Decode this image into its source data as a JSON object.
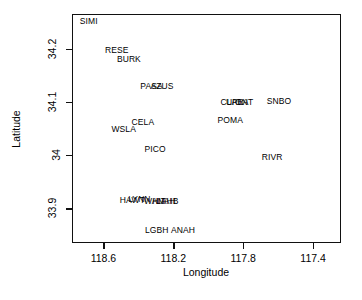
{
  "chart_data": {
    "type": "scatter",
    "title": "",
    "xlabel": "Longitude",
    "ylabel": "Latitude",
    "xlim": [
      118.78,
      117.24
    ],
    "ylim": [
      33.835,
      34.265
    ],
    "x_tick_labels": [
      "118.6",
      "118.2",
      "117.8",
      "117.4"
    ],
    "x_tick_values": [
      118.6,
      118.2,
      117.8,
      117.4
    ],
    "y_tick_labels": [
      "33.9",
      "34",
      "34.1",
      "34.2"
    ],
    "y_tick_values": [
      33.9,
      34.0,
      34.1,
      34.2
    ],
    "grid": false,
    "legend": "none",
    "marker": "text-label",
    "note": "Points are drawn as 4-letter station code text labels instead of symbols.",
    "points": [
      {
        "label": "SIMI",
        "x": 118.69,
        "y": 34.253
      },
      {
        "label": "RESE",
        "x": 118.53,
        "y": 34.199
      },
      {
        "label": "BURK",
        "x": 118.46,
        "y": 34.183
      },
      {
        "label": "PASA",
        "x": 118.33,
        "y": 34.132
      },
      {
        "label": "AZUS",
        "x": 118.27,
        "y": 34.132
      },
      {
        "label": "CLAR",
        "x": 117.87,
        "y": 34.102
      },
      {
        "label": "UPLA",
        "x": 117.84,
        "y": 34.102
      },
      {
        "label": "ONT",
        "x": 117.8,
        "y": 34.101
      },
      {
        "label": "SNBO",
        "x": 117.6,
        "y": 34.104
      },
      {
        "label": "POMA",
        "x": 117.88,
        "y": 34.068
      },
      {
        "label": "CELA",
        "x": 118.38,
        "y": 34.064
      },
      {
        "label": "WSLA",
        "x": 118.49,
        "y": 34.051
      },
      {
        "label": "PICO",
        "x": 118.31,
        "y": 34.013
      },
      {
        "label": "RIVR",
        "x": 117.64,
        "y": 33.998
      },
      {
        "label": "HAWT",
        "x": 118.44,
        "y": 33.917
      },
      {
        "label": "LYNN",
        "x": 118.4,
        "y": 33.919
      },
      {
        "label": "WHIT",
        "x": 118.31,
        "y": 33.916
      },
      {
        "label": "ANAH",
        "x": 118.26,
        "y": 33.916
      },
      {
        "label": "LAHB",
        "x": 118.24,
        "y": 33.916
      },
      {
        "label": "LGBH",
        "x": 118.3,
        "y": 33.862
      },
      {
        "label": "ANAH",
        "x": 118.15,
        "y": 33.862
      }
    ]
  }
}
